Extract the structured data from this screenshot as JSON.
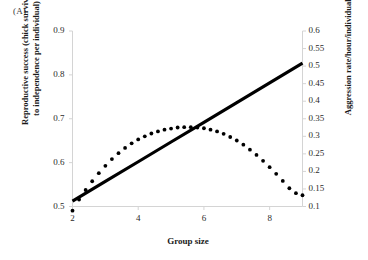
{
  "panel": {
    "label": "(A)"
  },
  "axes": {
    "x_title": "Group size",
    "left_title": "Reproductive success (chick survival\nto independence per individual)",
    "right_title": "Aggression rate/hour/individual"
  },
  "chart_data": {
    "type": "line",
    "title": "",
    "xlabel": "Group size",
    "ylabel": "Reproductive success (chick survival to independence per individual)",
    "y2label": "Aggression rate/hour/individual",
    "xlim": [
      2,
      9
    ],
    "ylim": [
      0.5,
      0.9
    ],
    "y2lim": [
      0.1,
      0.6
    ],
    "grid": false,
    "legend": "none",
    "xticks": [
      "2",
      "4",
      "6",
      "8"
    ],
    "xtick_values": [
      2,
      4,
      6,
      8
    ],
    "yticks": [
      "0.5",
      "0.6",
      "0.7",
      "0.8",
      "0.9"
    ],
    "ytick_values": [
      0.5,
      0.6,
      0.7,
      0.8,
      0.9
    ],
    "y2ticks": [
      "0.1",
      "0.15",
      "0.2",
      "0.25",
      "0.3",
      "0.35",
      "0.4",
      "0.45",
      "0.5",
      "0.55",
      "0.6"
    ],
    "y2tick_values": [
      0.1,
      0.15,
      0.2,
      0.25,
      0.3,
      0.35,
      0.4,
      0.45,
      0.5,
      0.55,
      0.6
    ],
    "series": [
      {
        "name": "Reproductive success",
        "axis": "left",
        "style": "solid",
        "color": "#000000",
        "x": [
          2,
          3,
          4,
          5,
          6,
          7,
          8,
          9
        ],
        "values": [
          0.512,
          0.557,
          0.602,
          0.647,
          0.692,
          0.737,
          0.782,
          0.827
        ]
      },
      {
        "name": "Aggression rate",
        "axis": "right",
        "style": "dotted",
        "color": "#000000",
        "x": [
          2.0,
          2.2,
          2.4,
          2.6,
          2.8,
          3.0,
          3.2,
          3.4,
          3.6,
          3.8,
          4.0,
          4.2,
          4.4,
          4.6,
          4.8,
          5.0,
          5.2,
          5.4,
          5.6,
          5.8,
          6.0,
          6.2,
          6.4,
          6.6,
          6.8,
          7.0,
          7.2,
          7.4,
          7.6,
          7.8,
          8.0,
          8.2,
          8.4,
          8.6,
          8.8,
          9.0
        ],
        "values": [
          0.088,
          0.12,
          0.147,
          0.172,
          0.195,
          0.216,
          0.235,
          0.252,
          0.267,
          0.28,
          0.291,
          0.3,
          0.308,
          0.314,
          0.319,
          0.322,
          0.325,
          0.326,
          0.326,
          0.325,
          0.323,
          0.319,
          0.314,
          0.307,
          0.298,
          0.288,
          0.276,
          0.262,
          0.247,
          0.23,
          0.212,
          0.193,
          0.173,
          0.152,
          0.138,
          0.132
        ]
      }
    ],
    "annotations": [
      {
        "text": "(A)",
        "position": "top-left"
      }
    ]
  }
}
